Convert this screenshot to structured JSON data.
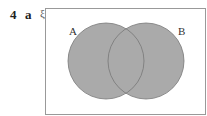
{
  "question": {
    "number": "4",
    "part": "a",
    "universal_symbol": "ξ"
  },
  "diagram": {
    "type": "venn",
    "sets": [
      {
        "label": "A"
      },
      {
        "label": "B"
      }
    ],
    "shaded_region": "A ∪ B",
    "fill_color": "#aaaaaa",
    "outline_color": "#777777"
  }
}
